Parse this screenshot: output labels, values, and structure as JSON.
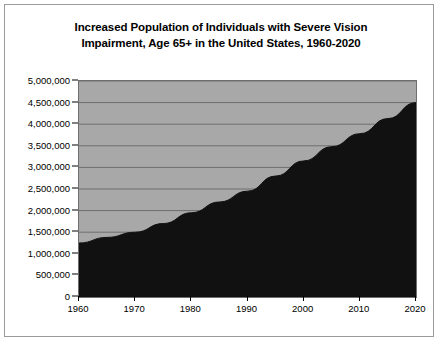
{
  "chart_data": {
    "type": "area",
    "title": "Increased Population of Individuals with Severe Vision Impairment, Age 65+ in the United States, 1960-2020",
    "title_line1": "Increased Population of Individuals with Severe Vision",
    "title_line2": "Impairment, Age 65+ in the United States, 1960-2020",
    "xlabel": "",
    "ylabel": "",
    "x": [
      1960,
      1965,
      1970,
      1975,
      1980,
      1985,
      1990,
      1995,
      2000,
      2005,
      2010,
      2015,
      2020
    ],
    "values": [
      1250000,
      1380000,
      1500000,
      1700000,
      1950000,
      2200000,
      2450000,
      2800000,
      3150000,
      3480000,
      3780000,
      4130000,
      4500000
    ],
    "x_tick_labels": [
      "1960",
      "1970",
      "1980",
      "1990",
      "2000",
      "2010",
      "2020"
    ],
    "x_ticks": [
      1960,
      1970,
      1980,
      1990,
      2000,
      2010,
      2020
    ],
    "xlim": [
      1960,
      2020
    ],
    "y_tick_labels": [
      "5,000,000",
      "4,500,000",
      "4,000,000",
      "3,500,000",
      "3,000,000",
      "2,500,000",
      "2,000,000",
      "1,500,000",
      "1,000,000",
      "500,000",
      "0"
    ],
    "y_ticks": [
      5000000,
      4500000,
      4000000,
      3500000,
      3000000,
      2500000,
      2000000,
      1500000,
      1000000,
      500000,
      0
    ],
    "ylim": [
      0,
      5000000
    ],
    "grid": "horizontal",
    "legend": "none",
    "series_color": "#111111",
    "plot_background": "#a8a8a8",
    "gridline_color": "#6e6e6e",
    "frame_color": "#9a9a9a"
  }
}
